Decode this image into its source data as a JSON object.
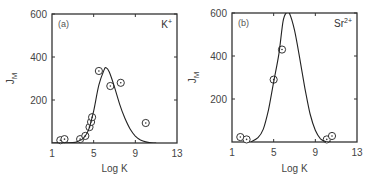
{
  "chart_data": [
    {
      "type": "scatter",
      "panel_label": "(a)",
      "ion_label": "K",
      "ion_charge": "+",
      "xlabel": "Log K",
      "ylabel": "J",
      "ylabel_sub": "M",
      "xlim": [
        1,
        13
      ],
      "ylim": [
        0,
        600
      ],
      "x_ticks": [
        1,
        5,
        9,
        13
      ],
      "y_ticks": [
        200,
        400,
        600
      ],
      "grid": false,
      "series": [
        {
          "name": "measured",
          "marker": "circled-dot",
          "points": [
            [
              1.8,
              13
            ],
            [
              2.2,
              18
            ],
            [
              3.7,
              18
            ],
            [
              4.2,
              33
            ],
            [
              4.6,
              74
            ],
            [
              4.75,
              98
            ],
            [
              4.85,
              120
            ],
            [
              5.5,
              335
            ],
            [
              6.6,
              265
            ],
            [
              7.6,
              280
            ],
            [
              10.0,
              93
            ]
          ]
        },
        {
          "name": "fit",
          "style": "line",
          "points": [
            [
              1,
              0
            ],
            [
              3,
              2
            ],
            [
              3.5,
              8
            ],
            [
              4,
              22
            ],
            [
              4.5,
              60
            ],
            [
              5,
              150
            ],
            [
              5.5,
              270
            ],
            [
              6,
              340
            ],
            [
              6.2,
              350
            ],
            [
              6.5,
              330
            ],
            [
              7,
              260
            ],
            [
              7.5,
              180
            ],
            [
              8,
              115
            ],
            [
              8.5,
              65
            ],
            [
              9,
              32
            ],
            [
              9.5,
              14
            ],
            [
              10,
              5
            ],
            [
              10.5,
              1
            ],
            [
              11,
              0
            ]
          ]
        }
      ]
    },
    {
      "type": "scatter",
      "panel_label": "(b)",
      "ion_label": "Sr",
      "ion_charge": "2+",
      "xlabel": "Log K",
      "ylabel": "J",
      "ylabel_sub": "M",
      "xlim": [
        1,
        13
      ],
      "ylim": [
        0,
        600
      ],
      "x_ticks": [
        1,
        5,
        9,
        13
      ],
      "y_ticks": [
        200,
        400,
        600
      ],
      "grid": false,
      "series": [
        {
          "name": "measured",
          "marker": "circled-dot",
          "points": [
            [
              1.8,
              23
            ],
            [
              2.4,
              12
            ],
            [
              5.0,
              290
            ],
            [
              5.8,
              430
            ],
            [
              10.1,
              12
            ],
            [
              10.6,
              28
            ]
          ]
        },
        {
          "name": "fit",
          "style": "line",
          "points": [
            [
              2.8,
              0
            ],
            [
              3.5,
              20
            ],
            [
              4,
              60
            ],
            [
              4.5,
              150
            ],
            [
              5,
              280
            ],
            [
              5.5,
              410
            ],
            [
              5.9,
              560
            ],
            [
              6.2,
              600
            ],
            [
              6.5,
              600
            ],
            [
              7,
              520
            ],
            [
              7.5,
              390
            ],
            [
              8,
              250
            ],
            [
              8.5,
              130
            ],
            [
              9,
              55
            ],
            [
              9.5,
              15
            ],
            [
              10,
              2
            ],
            [
              10.5,
              0
            ]
          ]
        }
      ]
    }
  ]
}
